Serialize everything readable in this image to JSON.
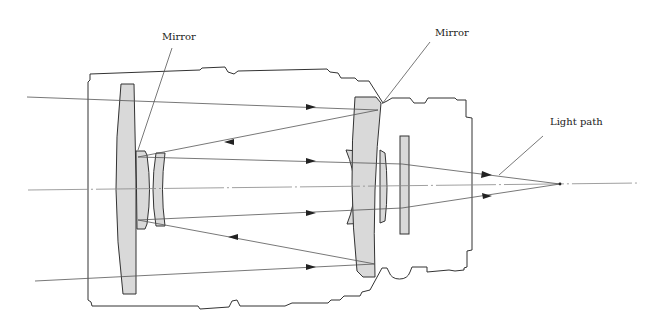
{
  "diagram": {
    "labels": {
      "mirror_left": "Mirror",
      "mirror_right": "Mirror",
      "light_path": "Light path"
    },
    "colors": {
      "background": "#ffffff",
      "outline": "#333333",
      "glass_fill": "#d9d9d9",
      "ray": "#555555",
      "axis": "#888888"
    },
    "components": [
      {
        "name": "front-corrector-lens"
      },
      {
        "name": "secondary-mirror"
      },
      {
        "name": "secondary-meniscus-lens"
      },
      {
        "name": "primary-mirror"
      },
      {
        "name": "primary-meniscus-lens"
      },
      {
        "name": "rear-filter-plate"
      },
      {
        "name": "lens-barrel-housing"
      }
    ]
  }
}
